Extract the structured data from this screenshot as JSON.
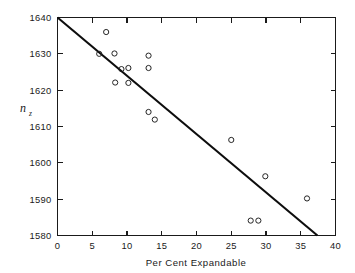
{
  "chart_data": {
    "type": "scatter",
    "title": "",
    "xlabel": "Per Cent Expandable",
    "ylabel": "n",
    "ylabel_subscript": "z",
    "xlim": [
      0,
      40
    ],
    "ylim": [
      1580,
      1640
    ],
    "xticks": [
      0,
      5,
      10,
      15,
      20,
      25,
      30,
      35,
      40
    ],
    "yticks": [
      1580,
      1590,
      1600,
      1610,
      1620,
      1630,
      1640
    ],
    "xtick_labels": [
      "0",
      "5",
      "10",
      "15",
      "20",
      "25",
      "30",
      "35",
      "40"
    ],
    "ytick_labels": [
      "1580",
      "1590",
      "1600",
      "1610",
      "1620",
      "1630",
      "1640"
    ],
    "grid": false,
    "legend": null,
    "points": [
      {
        "x": 7.0,
        "y": 1636.0
      },
      {
        "x": 6.0,
        "y": 1630.0
      },
      {
        "x": 8.2,
        "y": 1630.1
      },
      {
        "x": 9.2,
        "y": 1625.8
      },
      {
        "x": 10.2,
        "y": 1626.1
      },
      {
        "x": 8.3,
        "y": 1622.1
      },
      {
        "x": 10.2,
        "y": 1622.0
      },
      {
        "x": 13.1,
        "y": 1629.5
      },
      {
        "x": 13.1,
        "y": 1626.1
      },
      {
        "x": 13.1,
        "y": 1614.0
      },
      {
        "x": 14.0,
        "y": 1611.9
      },
      {
        "x": 25.0,
        "y": 1606.3
      },
      {
        "x": 29.9,
        "y": 1596.3
      },
      {
        "x": 27.8,
        "y": 1584.1
      },
      {
        "x": 28.9,
        "y": 1584.1
      },
      {
        "x": 35.9,
        "y": 1590.2
      }
    ],
    "fit_line": {
      "label": "regression-line",
      "x_start": 0.0,
      "y_start": 1640.0,
      "x_end": 37.4,
      "y_end": 1580.0,
      "slope": -1.604,
      "intercept": 1640.0,
      "color": "#0d0d0d"
    },
    "marker": {
      "shape": "open-circle",
      "radius_px": 2.6,
      "color": "#1a1a1a"
    },
    "background_color": "#ffffff",
    "axis_color": "#1a1a1a"
  }
}
